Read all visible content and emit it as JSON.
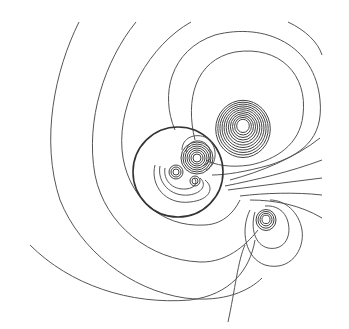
{
  "diagram": {
    "type": "contour-map",
    "background": "#ffffff",
    "line_color": "#555555",
    "boundary_circle": {
      "cx": 178,
      "cy": 172,
      "r": 45
    },
    "centers": [
      {
        "name": "right-lobe-center",
        "cx": 243,
        "cy": 125
      },
      {
        "name": "lower-right-lobe-center",
        "cx": 266,
        "cy": 219
      },
      {
        "name": "inner-nucleus-top",
        "cx": 197,
        "cy": 158
      },
      {
        "name": "inner-nucleus-left",
        "cx": 176,
        "cy": 172
      },
      {
        "name": "inner-nucleus-bottom",
        "cx": 195,
        "cy": 181
      }
    ],
    "right_lobe_rings": [
      6,
      8,
      10,
      12,
      14,
      16,
      18,
      20,
      22,
      24,
      26
    ],
    "lower_right_rings": [
      4,
      6,
      8,
      10
    ],
    "inner_top_rings": [
      4,
      6,
      8,
      10,
      12,
      14,
      16
    ],
    "inner_left_rings": [
      3,
      5,
      7
    ],
    "inner_bottom_rings": [
      3,
      5
    ]
  }
}
